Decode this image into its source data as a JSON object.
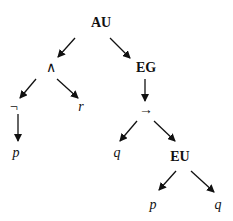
{
  "diagram": {
    "type": "syntax-tree",
    "nodes": [
      {
        "id": "n0",
        "label": "AU",
        "x": 101,
        "y": 23,
        "style": "bold"
      },
      {
        "id": "n1",
        "label": "∧",
        "x": 51,
        "y": 68,
        "style": "normal"
      },
      {
        "id": "n2",
        "label": "EG",
        "x": 146,
        "y": 68,
        "style": "bold"
      },
      {
        "id": "n3",
        "label": "¬",
        "x": 14,
        "y": 107,
        "style": "normal"
      },
      {
        "id": "n4",
        "label": "r",
        "x": 81,
        "y": 107,
        "style": "italic"
      },
      {
        "id": "n5",
        "label": "→",
        "x": 146,
        "y": 110,
        "style": "normal"
      },
      {
        "id": "n6",
        "label": "p",
        "x": 16,
        "y": 153,
        "style": "italic"
      },
      {
        "id": "n7",
        "label": "q",
        "x": 117,
        "y": 153,
        "style": "italic"
      },
      {
        "id": "n8",
        "label": "EU",
        "x": 180,
        "y": 157,
        "style": "bold"
      },
      {
        "id": "n9",
        "label": "p",
        "x": 153,
        "y": 205,
        "style": "italic"
      },
      {
        "id": "n10",
        "label": "q",
        "x": 218,
        "y": 205,
        "style": "italic"
      }
    ],
    "edges": [
      {
        "from": "n0",
        "to": "n1",
        "x1": 75,
        "y1": 38,
        "x2": 58,
        "y2": 57
      },
      {
        "from": "n0",
        "to": "n2",
        "x1": 110,
        "y1": 38,
        "x2": 130,
        "y2": 58
      },
      {
        "from": "n1",
        "to": "n3",
        "x1": 36,
        "y1": 79,
        "x2": 20,
        "y2": 98
      },
      {
        "from": "n1",
        "to": "n4",
        "x1": 57,
        "y1": 79,
        "x2": 78,
        "y2": 98
      },
      {
        "from": "n2",
        "to": "n5",
        "x1": 145,
        "y1": 79,
        "x2": 145,
        "y2": 101
      },
      {
        "from": "n3",
        "to": "n6",
        "x1": 18,
        "y1": 114,
        "x2": 18,
        "y2": 141
      },
      {
        "from": "n5",
        "to": "n7",
        "x1": 137,
        "y1": 121,
        "x2": 120,
        "y2": 141
      },
      {
        "from": "n5",
        "to": "n8",
        "x1": 154,
        "y1": 121,
        "x2": 175,
        "y2": 141
      },
      {
        "from": "n8",
        "to": "n9",
        "x1": 176,
        "y1": 171,
        "x2": 159,
        "y2": 190
      },
      {
        "from": "n8",
        "to": "n10",
        "x1": 191,
        "y1": 171,
        "x2": 214,
        "y2": 192
      }
    ]
  }
}
